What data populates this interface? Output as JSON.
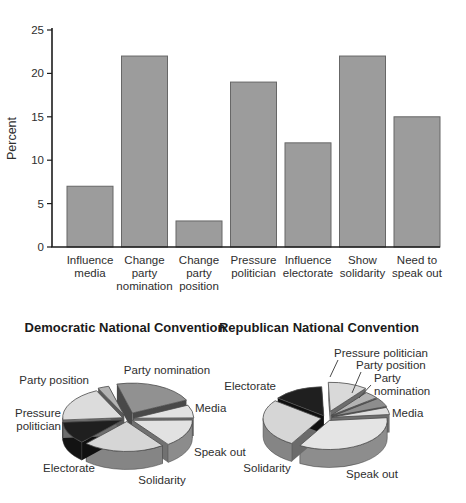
{
  "chart_data": [
    {
      "type": "bar",
      "title": "",
      "xlabel": "",
      "ylabel": "Percent",
      "ylim": [
        0,
        25
      ],
      "yticks": [
        0,
        5,
        10,
        15,
        20,
        25
      ],
      "grid": false,
      "legend": "none",
      "categories": [
        "Influence media",
        "Change party nomination",
        "Change party position",
        "Pressure politician",
        "Influence electorate",
        "Show solidarity",
        "Need to speak out"
      ],
      "category_lines": [
        [
          "Influence",
          "media"
        ],
        [
          "Change",
          "party",
          "nomination"
        ],
        [
          "Change",
          "party",
          "position"
        ],
        [
          "Pressure",
          "politician"
        ],
        [
          "Influence",
          "electorate"
        ],
        [
          "Show",
          "solidarity"
        ],
        [
          "Need to",
          "speak out"
        ]
      ],
      "values": [
        7,
        22,
        3,
        19,
        12,
        22,
        15
      ],
      "colors": {
        "bar": "#9c9c9c",
        "bar_edge": "#676767",
        "axis": "#1c1c1c",
        "text": "#333333"
      },
      "layout": {
        "x0": 67,
        "pitch": 54.5,
        "bar_width": 46,
        "baseline_y": 247,
        "top_y": 30,
        "axis_x": 52,
        "axis_right": 440,
        "label_y": 264,
        "label_line_h": 13,
        "ylabel_x": 16,
        "tick_len": 5
      }
    },
    {
      "type": "pie",
      "title": "Democratic National Convention",
      "slices": [
        {
          "label": "Party nomination",
          "value": 22,
          "color": "#919191",
          "explode": 13,
          "label_at": [
            167,
            374
          ],
          "anchor": "middle"
        },
        {
          "label": "Media",
          "value": 7,
          "color": "#e2e2e2",
          "explode": 7,
          "label_at": [
            195,
            412
          ],
          "anchor": "start"
        },
        {
          "label": "Speak out",
          "value": 15,
          "color": "#e2e2e2",
          "explode": 6,
          "label_at": [
            194,
            456
          ],
          "anchor": "start"
        },
        {
          "label": "Solidarity",
          "value": 22,
          "color": "#d6d6d6",
          "explode": 5,
          "label_at": [
            162,
            484
          ],
          "anchor": "middle"
        },
        {
          "label": "Electorate",
          "value": 12,
          "color": "#1f1f1f",
          "explode": 5,
          "label_at": [
            69,
            472
          ],
          "anchor": "middle"
        },
        {
          "label": "Pressure politician",
          "lines": [
            "Pressure",
            "politician"
          ],
          "value": 19,
          "color": "#dcdcdc",
          "explode": 5,
          "label_at": [
            61,
            417
          ],
          "anchor": "end"
        },
        {
          "label": "Party position",
          "value": 3,
          "color": "#b3b3b3",
          "explode": 8,
          "label_at": [
            89,
            384
          ],
          "anchor": "end"
        }
      ],
      "layout": {
        "cx": 127,
        "cy": 419,
        "rx": 60,
        "ry": 30,
        "depth": 18,
        "start_angle": 255
      }
    },
    {
      "type": "pie",
      "title": "Republican National Convention",
      "slices": [
        {
          "label": "Pressure politician",
          "value": 11,
          "color": "#d9d9d9",
          "explode": 14,
          "label_at": [
            334,
            357
          ],
          "anchor": "start",
          "leader": [
            [
              338,
              360
            ],
            [
              330,
              377
            ]
          ]
        },
        {
          "label": "Party position",
          "value": 4,
          "color": "#b3b3b3",
          "explode": 7,
          "label_at": [
            356,
            369
          ],
          "anchor": "start",
          "leader": [
            [
              361,
              372
            ],
            [
              352,
              393
            ]
          ]
        },
        {
          "label": "Party nomination",
          "lines": [
            "Party",
            "nomination"
          ],
          "value": 5,
          "color": "#8d8d8d",
          "explode": 7,
          "label_at": [
            374,
            382
          ],
          "anchor": "start",
          "leader": [
            [
              371,
              385
            ],
            [
              359,
              398
            ]
          ]
        },
        {
          "label": "Media",
          "value": 4,
          "color": "#dedede",
          "explode": 6,
          "label_at": [
            392,
            417
          ],
          "anchor": "start"
        },
        {
          "label": "Speak out",
          "value": 35,
          "color": "#e4e4e4",
          "explode": 6,
          "label_at": [
            372,
            478
          ],
          "anchor": "middle"
        },
        {
          "label": "Solidarity",
          "value": 27,
          "color": "#d6d6d6",
          "explode": 5,
          "label_at": [
            267,
            472
          ],
          "anchor": "middle"
        },
        {
          "label": "Electorate",
          "value": 14,
          "color": "#1f1f1f",
          "explode": 5,
          "label_at": [
            276,
            390
          ],
          "anchor": "end"
        }
      ],
      "layout": {
        "cx": 326,
        "cy": 418,
        "rx": 58,
        "ry": 29,
        "depth": 18,
        "start_angle": 268
      }
    }
  ]
}
